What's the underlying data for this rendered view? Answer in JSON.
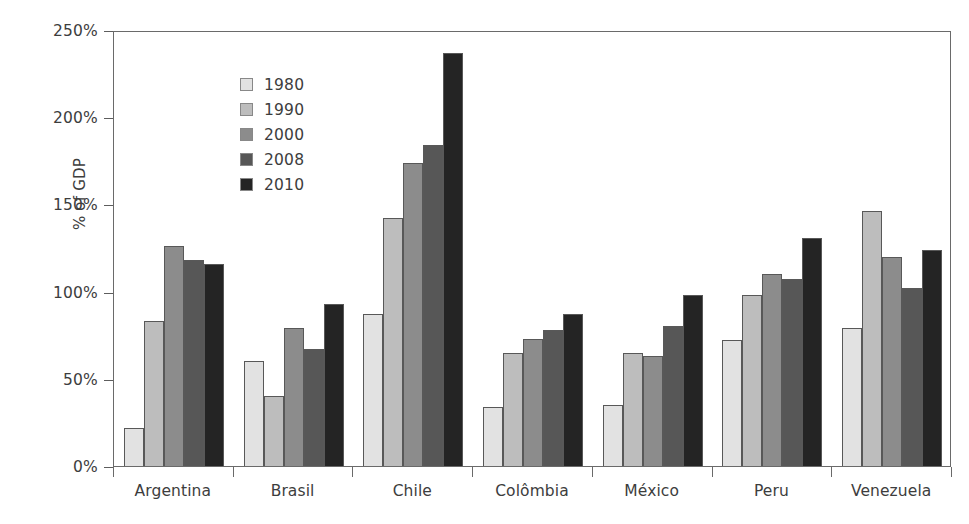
{
  "chart_data": {
    "type": "bar",
    "title": "",
    "xlabel": "",
    "ylabel": "% of GDP",
    "ylim": [
      0,
      250
    ],
    "yticks": [
      "0%",
      "50%",
      "100%",
      "150%",
      "200%",
      "250%"
    ],
    "ytick_values": [
      0,
      50,
      100,
      150,
      200,
      250
    ],
    "grid": false,
    "legend_position": "top-left inside plot",
    "categories": [
      "Argentina",
      "Brasil",
      "Chile",
      "Colômbia",
      "México",
      "Peru",
      "Venezuela"
    ],
    "series": [
      {
        "name": "1980",
        "color": "#e2e2e2",
        "values": [
          22,
          60,
          87,
          34,
          35,
          72,
          79
        ]
      },
      {
        "name": "1990",
        "color": "#bdbdbd",
        "values": [
          83,
          40,
          142,
          65,
          65,
          98,
          146
        ]
      },
      {
        "name": "2000",
        "color": "#8c8c8c",
        "values": [
          126,
          79,
          174,
          73,
          63,
          110,
          120
        ]
      },
      {
        "name": "2008",
        "color": "#575757",
        "values": [
          118,
          67,
          184,
          78,
          80,
          107,
          102
        ]
      },
      {
        "name": "2010",
        "color": "#242424",
        "values": [
          116,
          93,
          237,
          87,
          98,
          131,
          124
        ]
      }
    ]
  },
  "axis": {
    "y_title": "% of GDP"
  }
}
